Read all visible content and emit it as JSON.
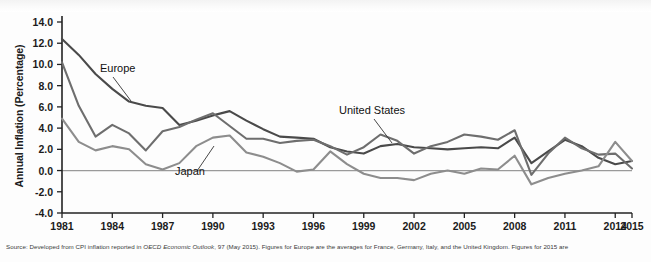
{
  "figure": {
    "y_axis_title": "Annual Inflation (Percentage)",
    "source_prefix": "Source: Developed from CPI inflation reported in ",
    "source_italic": "OECD Economic Outlook",
    "source_suffix": ", 97 (May 2015). Figures for Europe are the averages for France, Germany, Italy, and the United Kingdom. Figures for 2015 are"
  },
  "annotations": {
    "europe": "Europe",
    "japan": "Japan",
    "united_states": "United States"
  },
  "colors": {
    "europe": "#4a4a4a",
    "united_states": "#6e6e6e",
    "japan": "#8d8d8d",
    "axis": "#222222",
    "zero_line": "#9a9a9a",
    "background": "#fdfdfd"
  },
  "chart_data": {
    "type": "line",
    "title": "",
    "xlabel": "",
    "ylabel": "Annual Inflation (Percentage)",
    "xlim": [
      1981,
      2015
    ],
    "ylim": [
      -4.0,
      14.0
    ],
    "ytick_step": 2.0,
    "grid": false,
    "legend": "inline-annotations",
    "ytick_labels": [
      "14.0",
      "12.0",
      "10.0",
      "8.0",
      "6.0",
      "4.0",
      "2.0",
      "0.0",
      "-2.0",
      "-4.0"
    ],
    "ytick_values": [
      14.0,
      12.0,
      10.0,
      8.0,
      6.0,
      4.0,
      2.0,
      0.0,
      -2.0,
      -4.0
    ],
    "xtick_labels": [
      "1981",
      "1984",
      "1987",
      "1990",
      "1993",
      "1996",
      "1999",
      "2002",
      "2005",
      "2008",
      "2011",
      "2014",
      "2015"
    ],
    "xtick_values": [
      1981,
      1984,
      1987,
      1990,
      1993,
      1996,
      1999,
      2002,
      2005,
      2008,
      2011,
      2014,
      2015
    ],
    "x": [
      1981,
      1982,
      1983,
      1984,
      1985,
      1986,
      1987,
      1988,
      1989,
      1990,
      1991,
      1992,
      1993,
      1994,
      1995,
      1996,
      1997,
      1998,
      1999,
      2000,
      2001,
      2002,
      2003,
      2004,
      2005,
      2006,
      2007,
      2008,
      2009,
      2010,
      2011,
      2012,
      2013,
      2014,
      2015
    ],
    "series": [
      {
        "name": "Europe",
        "color": "#4a4a4a",
        "values": [
          12.4,
          10.9,
          9.1,
          7.7,
          6.5,
          6.1,
          5.9,
          4.3,
          4.7,
          5.2,
          5.6,
          4.7,
          3.9,
          3.2,
          3.1,
          3.0,
          2.2,
          1.8,
          1.6,
          2.3,
          2.5,
          2.2,
          2.1,
          2.0,
          2.1,
          2.2,
          2.1,
          3.1,
          0.7,
          1.8,
          2.9,
          2.3,
          1.2,
          0.6,
          0.9
        ]
      },
      {
        "name": "United States",
        "color": "#6e6e6e",
        "values": [
          10.2,
          6.1,
          3.2,
          4.3,
          3.5,
          1.9,
          3.7,
          4.1,
          4.8,
          5.4,
          4.2,
          3.0,
          3.0,
          2.6,
          2.8,
          2.9,
          2.3,
          1.5,
          2.2,
          3.4,
          2.8,
          1.6,
          2.3,
          2.7,
          3.4,
          3.2,
          2.9,
          3.8,
          -0.4,
          1.6,
          3.1,
          2.1,
          1.5,
          1.6,
          0.2
        ]
      },
      {
        "name": "Japan",
        "color": "#8d8d8d",
        "values": [
          4.9,
          2.7,
          1.9,
          2.3,
          2.0,
          0.6,
          0.1,
          0.7,
          2.3,
          3.1,
          3.3,
          1.7,
          1.3,
          0.7,
          -0.1,
          0.1,
          1.8,
          0.6,
          -0.3,
          -0.7,
          -0.7,
          -0.9,
          -0.3,
          0.0,
          -0.3,
          0.2,
          0.1,
          1.4,
          -1.3,
          -0.7,
          -0.3,
          0.0,
          0.4,
          2.7,
          0.9
        ]
      }
    ]
  }
}
